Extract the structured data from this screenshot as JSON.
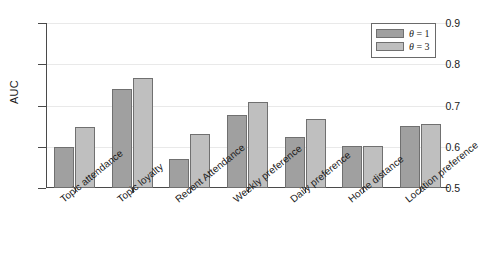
{
  "chart_data": {
    "type": "bar",
    "title": "",
    "xlabel": "",
    "ylabel": "AUC",
    "ylim": [
      0.5,
      0.9
    ],
    "yticks": [
      0.5,
      0.6,
      0.7,
      0.8,
      0.9
    ],
    "ytick_labels": [
      "0.5",
      "0.6",
      "0.7",
      "0.8",
      "0.9"
    ],
    "grid": true,
    "grid_axis": "y",
    "legend_position": "upper right",
    "categories": [
      "Topic attendance",
      "Topic loyalty",
      "Recent Attendance",
      "Weekly preference",
      "Daily preference",
      "Home distance",
      "Location preference"
    ],
    "series": [
      {
        "name": "theta = 1",
        "legend_label": "θ = 1",
        "symbol": "θ",
        "value_label": "1",
        "color": "#a0a0a0",
        "values": [
          0.6,
          0.739,
          0.57,
          0.678,
          0.623,
          0.602,
          0.65
        ]
      },
      {
        "name": "theta = 3",
        "legend_label": "θ = 3",
        "symbol": "θ",
        "value_label": "3",
        "color": "#bfbfbf",
        "values": [
          0.649,
          0.766,
          0.63,
          0.709,
          0.668,
          0.603,
          0.656
        ]
      }
    ]
  }
}
